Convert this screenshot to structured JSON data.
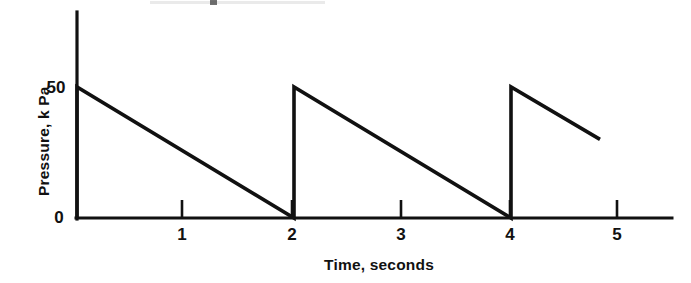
{
  "chart_data": {
    "type": "line",
    "title": "",
    "subtitle": "",
    "xlabel": "Time, seconds",
    "ylabel": "Pressure, k Pa",
    "xlim": [
      0,
      5.5
    ],
    "ylim": [
      0,
      79
    ],
    "xticks": [
      1,
      2,
      3,
      4,
      5
    ],
    "xtick_labels": [
      "1",
      "2",
      "3",
      "4",
      "5"
    ],
    "yticks": [
      0,
      50
    ],
    "ytick_labels": [
      "0",
      "50"
    ],
    "grid": false,
    "legend": null,
    "line_color": "#111111",
    "background_color": "#ffffff",
    "series": [
      {
        "name": "Pressure",
        "description": "Sawtooth waveform: instantaneous rise to 50 kPa then linear decay to 0 kPa over 2 seconds, repeating",
        "x": [
          0,
          0,
          2,
          2,
          4,
          4,
          4.82
        ],
        "y": [
          0,
          50,
          0,
          50,
          0,
          50,
          30
        ]
      }
    ],
    "annotations": []
  },
  "axes": {
    "y_tick_50": "50",
    "y_tick_0": "0",
    "x_tick_1": "1",
    "x_tick_2": "2",
    "x_tick_3": "3",
    "x_tick_4": "4",
    "x_tick_5": "5",
    "y_title": "Pressure, k Pa",
    "x_title": "Time, seconds"
  }
}
